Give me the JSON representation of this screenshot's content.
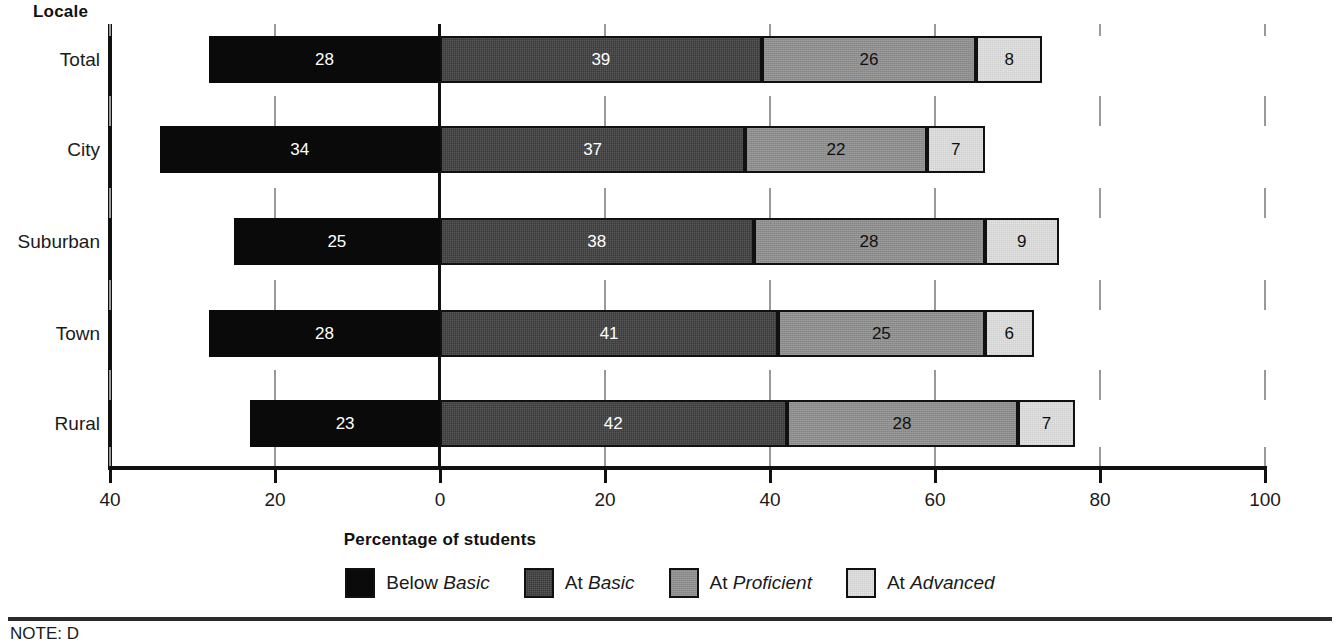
{
  "chart_data": {
    "type": "bar",
    "subtype": "diverging-stacked-bar",
    "title": "",
    "xlabel": "Percentage of students",
    "ylabel": "Locale",
    "xlim": [
      -40,
      100
    ],
    "xticks": [
      -40,
      -20,
      0,
      20,
      40,
      60,
      80,
      100
    ],
    "xticklabels": [
      "40",
      "20",
      "0",
      "20",
      "40",
      "60",
      "80",
      "100"
    ],
    "grid": true,
    "legend_position": "bottom",
    "categories": [
      "Total",
      "City",
      "Suburban",
      "Town",
      "Rural"
    ],
    "series": [
      {
        "name": "Below Basic",
        "values": [
          28,
          34,
          25,
          28,
          23
        ],
        "color": "#0a0a0a",
        "side": "left"
      },
      {
        "name": "At Basic",
        "values": [
          39,
          37,
          38,
          41,
          42
        ],
        "color": "#3a3a3a",
        "side": "right"
      },
      {
        "name": "At Proficient",
        "values": [
          26,
          22,
          28,
          25,
          28
        ],
        "color": "#8e8e8e",
        "side": "right"
      },
      {
        "name": "At Advanced",
        "values": [
          8,
          7,
          9,
          6,
          7
        ],
        "color": "#e3e3e3",
        "side": "right"
      }
    ]
  },
  "axis": {
    "locale_header": "Locale",
    "x_title": "Percentage of students",
    "tick_labels": [
      "40",
      "20",
      "0",
      "20",
      "40",
      "60",
      "80",
      "100"
    ],
    "category_labels": [
      "Total",
      "City",
      "Suburban",
      "Town",
      "Rural"
    ]
  },
  "legend": {
    "items": [
      {
        "prefix": "Below ",
        "level": "Basic",
        "key": "below-basic"
      },
      {
        "prefix": "At ",
        "level": "Basic",
        "key": "at-basic"
      },
      {
        "prefix": "At ",
        "level": "Proficient",
        "key": "at-proficient"
      },
      {
        "prefix": "At ",
        "level": "Advanced",
        "key": "at-advanced"
      }
    ]
  },
  "bar_labels": {
    "total": [
      "28",
      "39",
      "26",
      "8"
    ],
    "city": [
      "34",
      "37",
      "22",
      "7"
    ],
    "suburban": [
      "25",
      "38",
      "28",
      "9"
    ],
    "town": [
      "28",
      "41",
      "25",
      "6"
    ],
    "rural": [
      "23",
      "42",
      "28",
      "7"
    ]
  },
  "footer": {
    "note": "NOTE: D"
  }
}
